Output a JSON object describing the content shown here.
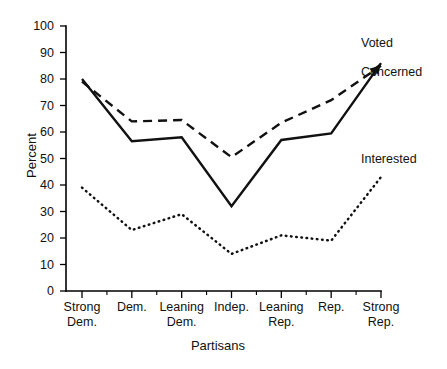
{
  "chart_data": {
    "type": "line",
    "title": "",
    "xlabel": "Partisans",
    "ylabel": "Percent",
    "ylim": [
      0,
      100
    ],
    "yticks": [
      0,
      10,
      20,
      30,
      40,
      50,
      60,
      70,
      80,
      90,
      100
    ],
    "ytick_labels": [
      "0",
      "10",
      "20",
      "30",
      "40",
      "50",
      "60",
      "70",
      "80",
      "90",
      "100"
    ],
    "grid": false,
    "legend_position": "right-inline",
    "categories": [
      "Strong Dem.",
      "Dem.",
      "Leaning Dem.",
      "Indep.",
      "Leaning Rep.",
      "Rep.",
      "Strong Rep."
    ],
    "category_lines": [
      [
        "Strong",
        "Dem."
      ],
      [
        "Dem.",
        ""
      ],
      [
        "Leaning",
        "Dem."
      ],
      [
        "Indep.",
        ""
      ],
      [
        "Leaning",
        "Rep."
      ],
      [
        "Rep.",
        ""
      ],
      [
        "Strong",
        "Rep."
      ]
    ],
    "series": [
      {
        "name": "Voted",
        "style": "solid",
        "values": [
          80,
          56.5,
          58,
          32,
          57,
          59.5,
          86
        ]
      },
      {
        "name": "Concerned",
        "style": "dashed",
        "values": [
          79,
          64,
          64.5,
          50.5,
          63.5,
          72,
          85
        ]
      },
      {
        "name": "Interested",
        "style": "dotted",
        "values": [
          39,
          23,
          29,
          14,
          21,
          19,
          43
        ]
      }
    ]
  },
  "axis": {
    "y_title": "Percent",
    "x_title": "Partisans"
  },
  "legend": {
    "voted": "Voted",
    "concerned": "Concerned",
    "interested": "Interested"
  }
}
